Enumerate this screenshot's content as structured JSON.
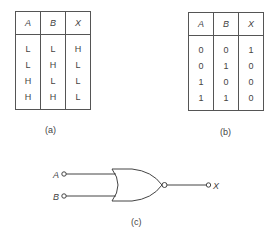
{
  "table_a": {
    "headers": [
      "A",
      "B",
      "X"
    ],
    "rows": [
      [
        "L",
        "L",
        "H"
      ],
      [
        "L",
        "H",
        "L"
      ],
      [
        "H",
        "L",
        "L"
      ],
      [
        "H",
        "H",
        "L"
      ]
    ],
    "caption": "(a)"
  },
  "table_b": {
    "headers": [
      "A",
      "B",
      "X"
    ],
    "rows": [
      [
        "0",
        "0",
        "1"
      ],
      [
        "0",
        "1",
        "0"
      ],
      [
        "1",
        "0",
        "0"
      ],
      [
        "1",
        "1",
        "0"
      ]
    ],
    "caption": "(b)"
  },
  "gate": {
    "type": "NOR",
    "inputs": [
      "A",
      "B"
    ],
    "output": "X",
    "caption": "(c)"
  }
}
